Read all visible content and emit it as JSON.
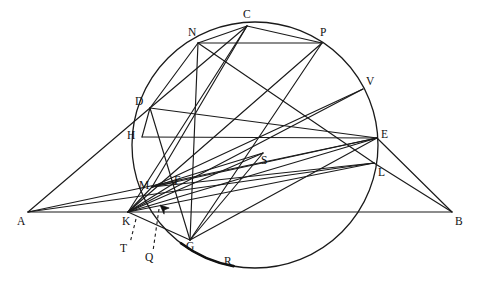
{
  "figure": {
    "type": "euclidean-geometry-diagram",
    "canvas": {
      "width": 479,
      "height": 282
    },
    "background_color": "#ffffff",
    "stroke_color": "#1a1a1a"
  },
  "circle": {
    "name": "main-circle",
    "center_x": 255,
    "center_y": 145,
    "radius": 123
  },
  "points": [
    {
      "id": "A",
      "label": "A",
      "x": 28,
      "y": 212,
      "label_x": 17,
      "label_y": 216,
      "on_circle": false
    },
    {
      "id": "B",
      "label": "B",
      "x": 452,
      "y": 212,
      "label_x": 455,
      "label_y": 216,
      "on_circle": false
    },
    {
      "id": "C",
      "label": "C",
      "x": 247,
      "y": 26,
      "label_x": 243,
      "label_y": 9,
      "on_circle": true
    },
    {
      "id": "N",
      "label": "N",
      "x": 198,
      "y": 43,
      "label_x": 188,
      "label_y": 27,
      "on_circle": true
    },
    {
      "id": "P",
      "label": "P",
      "x": 322,
      "y": 43,
      "label_x": 320,
      "label_y": 27,
      "on_circle": true
    },
    {
      "id": "V",
      "label": "V",
      "x": 363,
      "y": 89,
      "label_x": 366,
      "label_y": 76,
      "on_circle": true
    },
    {
      "id": "D",
      "label": "D",
      "x": 150,
      "y": 108,
      "label_x": 135,
      "label_y": 96,
      "on_circle": true
    },
    {
      "id": "H",
      "label": "H",
      "x": 142,
      "y": 137,
      "label_x": 127,
      "label_y": 130,
      "on_circle": true
    },
    {
      "id": "E",
      "label": "E",
      "x": 377,
      "y": 138,
      "label_x": 381,
      "label_y": 129,
      "on_circle": true
    },
    {
      "id": "L",
      "label": "L",
      "x": 374,
      "y": 163,
      "label_x": 378,
      "label_y": 167,
      "on_circle": true
    },
    {
      "id": "S",
      "label": "S",
      "x": 263,
      "y": 153,
      "label_x": 261,
      "label_y": 155,
      "on_circle": false
    },
    {
      "id": "M",
      "label": "M",
      "x": 152,
      "y": 187,
      "label_x": 139,
      "label_y": 180,
      "on_circle": false
    },
    {
      "id": "F",
      "label": "F",
      "x": 176,
      "y": 182,
      "label_x": 174,
      "label_y": 175,
      "on_circle": false
    },
    {
      "id": "K",
      "label": "K",
      "x": 128,
      "y": 212,
      "label_x": 122,
      "label_y": 216,
      "on_circle": false
    },
    {
      "id": "G",
      "label": "G",
      "x": 190,
      "y": 240,
      "label_x": 186,
      "label_y": 241,
      "on_circle": true
    },
    {
      "id": "R",
      "label": "R",
      "x": 227,
      "y": 256,
      "label_x": 224,
      "label_y": 256,
      "on_circle": true
    },
    {
      "id": "T",
      "label": "T",
      "x": 127,
      "y": 248,
      "label_x": 120,
      "label_y": 243,
      "on_circle": false
    },
    {
      "id": "Q",
      "label": "Q",
      "x": 151,
      "y": 257,
      "label_x": 145,
      "label_y": 252,
      "on_circle": false
    }
  ],
  "segments": [
    {
      "name": "segment-A-B",
      "from": "A",
      "to": "B"
    },
    {
      "name": "segment-A-D",
      "from": "A",
      "to": "D"
    },
    {
      "name": "segment-A-E",
      "from": "A",
      "to": "E"
    },
    {
      "name": "segment-A-L",
      "from": "A",
      "to": "L"
    },
    {
      "name": "segment-D-E",
      "from": "D",
      "to": "E"
    },
    {
      "name": "segment-D-N",
      "from": "D",
      "to": "N"
    },
    {
      "name": "segment-D-C",
      "from": "D",
      "to": "C"
    },
    {
      "name": "segment-D-G",
      "from": "D",
      "to": "G"
    },
    {
      "name": "segment-H-E",
      "from": "H",
      "to": "E"
    },
    {
      "name": "segment-N-P",
      "from": "N",
      "to": "P"
    },
    {
      "name": "segment-N-C",
      "from": "N",
      "to": "C"
    },
    {
      "name": "segment-N-G",
      "from": "N",
      "to": "G"
    },
    {
      "name": "segment-N-L",
      "from": "N",
      "to": "L"
    },
    {
      "name": "segment-C-P",
      "from": "C",
      "to": "P"
    },
    {
      "name": "segment-C-M",
      "from": "C",
      "to": "M"
    },
    {
      "name": "segment-C-K",
      "from": "C",
      "to": "K"
    },
    {
      "name": "segment-P-K",
      "from": "P",
      "to": "K"
    },
    {
      "name": "segment-P-G",
      "from": "P",
      "to": "G"
    },
    {
      "name": "segment-V-K",
      "from": "V",
      "to": "K"
    },
    {
      "name": "segment-V-M",
      "from": "V",
      "to": "M"
    },
    {
      "name": "segment-E-B",
      "from": "E",
      "to": "B"
    },
    {
      "name": "segment-L-B",
      "from": "L",
      "to": "B"
    },
    {
      "name": "segment-E-K",
      "from": "E",
      "to": "K"
    },
    {
      "name": "segment-L-K",
      "from": "L",
      "to": "K"
    },
    {
      "name": "segment-L-M",
      "from": "L",
      "to": "M"
    },
    {
      "name": "segment-E-M",
      "from": "E",
      "to": "M"
    },
    {
      "name": "segment-S-K",
      "from": "S",
      "to": "K"
    },
    {
      "name": "segment-S-G",
      "from": "S",
      "to": "G"
    },
    {
      "name": "segment-S-M",
      "from": "S",
      "to": "M"
    },
    {
      "name": "segment-K-G",
      "from": "K",
      "to": "G"
    },
    {
      "name": "segment-K-M",
      "from": "K",
      "to": "M"
    },
    {
      "name": "segment-M-F",
      "from": "M",
      "to": "F"
    },
    {
      "name": "segment-K-F",
      "from": "K",
      "to": "F"
    },
    {
      "name": "segment-H-D",
      "from": "H",
      "to": "D"
    },
    {
      "name": "segment-G-E",
      "from": "G",
      "to": "E"
    }
  ],
  "leaders": [
    {
      "name": "leader-to-T",
      "from_x": 136,
      "from_y": 219,
      "to_x": 130,
      "to_y": 243
    },
    {
      "name": "leader-to-Q",
      "from_x": 159,
      "from_y": 209,
      "to_x": 153,
      "to_y": 251
    }
  ],
  "markers": [
    {
      "name": "arrowhead-marker",
      "x": 160,
      "y": 205,
      "angle": -140
    }
  ],
  "emphasized_arcs": [
    {
      "name": "arc-G-R-thick",
      "start_angle": 127,
      "end_angle": 100
    }
  ]
}
